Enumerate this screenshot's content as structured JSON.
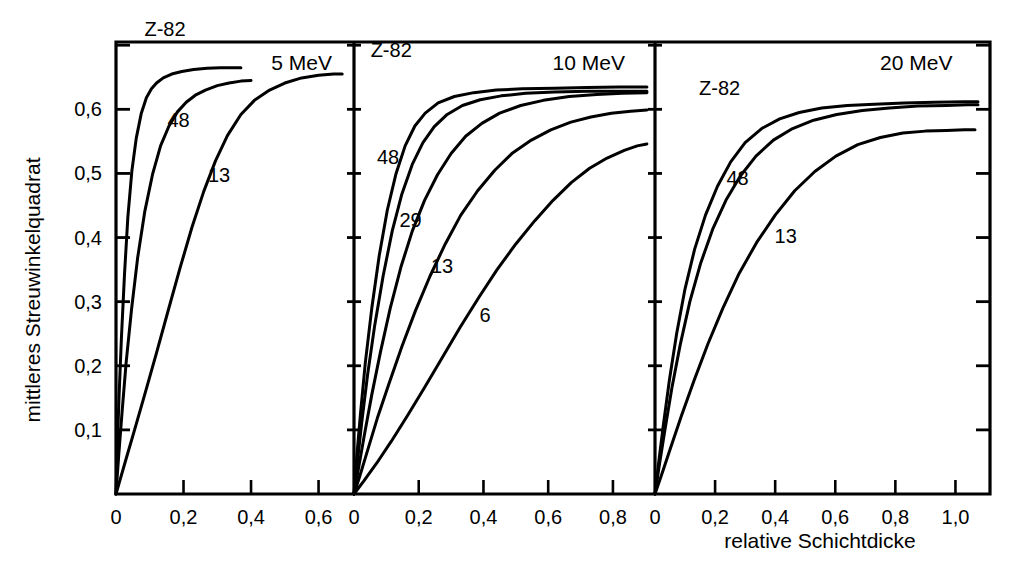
{
  "chart_data": {
    "type": "line",
    "title": "",
    "xlabel": "relative Schichtdicke",
    "ylabel": "mittleres Streuwinkelquadrat",
    "grid": false,
    "legend_position": "inline-curve-labels",
    "decimal_separator": "comma",
    "ylim": [
      0,
      0.705
    ],
    "y_ticks": [
      0.1,
      0.2,
      0.3,
      0.4,
      0.5,
      0.6,
      0.7
    ],
    "y_tick_labels": [
      "0,1",
      "0,2",
      "0,3",
      "0,4",
      "0,5",
      "0,6",
      ""
    ],
    "panels": [
      {
        "title": "5 MeV",
        "xlim": [
          0,
          0.705
        ],
        "x_ticks": [
          0,
          0.2,
          0.4,
          0.6
        ],
        "x_tick_labels": [
          "0",
          "0,2",
          "0,4",
          "0,6"
        ],
        "series": [
          {
            "name": "Z-82",
            "label": "Z-82",
            "x": [
              0,
              0.004,
              0.009,
              0.016,
              0.025,
              0.035,
              0.047,
              0.06,
              0.075,
              0.09,
              0.105,
              0.12,
              0.14,
              0.165,
              0.195,
              0.23,
              0.27,
              0.31,
              0.345,
              0.37
            ],
            "y": [
              0,
              0.075,
              0.152,
              0.243,
              0.341,
              0.431,
              0.504,
              0.555,
              0.594,
              0.618,
              0.632,
              0.641,
              0.649,
              0.655,
              0.659,
              0.662,
              0.664,
              0.665,
              0.665,
              0.665
            ]
          },
          {
            "name": "48",
            "label": "48",
            "x": [
              0,
              0.008,
              0.018,
              0.03,
              0.046,
              0.064,
              0.085,
              0.108,
              0.132,
              0.157,
              0.182,
              0.208,
              0.235,
              0.265,
              0.3,
              0.335,
              0.37,
              0.4
            ],
            "y": [
              0,
              0.06,
              0.128,
              0.205,
              0.288,
              0.368,
              0.44,
              0.498,
              0.543,
              0.574,
              0.596,
              0.611,
              0.622,
              0.63,
              0.637,
              0.641,
              0.644,
              0.645
            ]
          },
          {
            "name": "13",
            "label": "13",
            "x": [
              0,
              0.012,
              0.03,
              0.055,
              0.085,
              0.12,
              0.155,
              0.19,
              0.225,
              0.26,
              0.295,
              0.33,
              0.37,
              0.41,
              0.455,
              0.5,
              0.55,
              0.6,
              0.645,
              0.67
            ],
            "y": [
              0,
              0.022,
              0.055,
              0.1,
              0.155,
              0.22,
              0.287,
              0.353,
              0.416,
              0.472,
              0.52,
              0.559,
              0.592,
              0.614,
              0.63,
              0.641,
              0.649,
              0.653,
              0.655,
              0.655
            ]
          }
        ]
      },
      {
        "title": "10 MeV",
        "xlim": [
          0,
          0.93
        ],
        "x_ticks": [
          0,
          0.2,
          0.4,
          0.6,
          0.8
        ],
        "x_tick_labels": [
          "0",
          "0,2",
          "0,4",
          "0,6",
          "0,8"
        ],
        "series": [
          {
            "name": "Z-82",
            "label": "Z-82",
            "x": [
              0,
              0.008,
              0.02,
              0.035,
              0.055,
              0.078,
              0.103,
              0.13,
              0.158,
              0.188,
              0.22,
              0.26,
              0.31,
              0.37,
              0.44,
              0.52,
              0.62,
              0.72,
              0.82,
              0.905
            ],
            "y": [
              0,
              0.055,
              0.125,
              0.205,
              0.29,
              0.372,
              0.443,
              0.5,
              0.543,
              0.574,
              0.594,
              0.61,
              0.62,
              0.626,
              0.63,
              0.632,
              0.633,
              0.634,
              0.635,
              0.635
            ]
          },
          {
            "name": "48",
            "label": "48",
            "x": [
              0,
              0.01,
              0.024,
              0.042,
              0.064,
              0.09,
              0.118,
              0.148,
              0.18,
              0.213,
              0.248,
              0.288,
              0.335,
              0.39,
              0.455,
              0.53,
              0.62,
              0.72,
              0.82,
              0.905
            ],
            "y": [
              0,
              0.048,
              0.112,
              0.186,
              0.263,
              0.34,
              0.41,
              0.468,
              0.514,
              0.548,
              0.573,
              0.592,
              0.606,
              0.615,
              0.621,
              0.625,
              0.627,
              0.628,
              0.628,
              0.628
            ]
          },
          {
            "name": "29",
            "label": "29",
            "x": [
              0,
              0.014,
              0.032,
              0.055,
              0.082,
              0.112,
              0.145,
              0.18,
              0.218,
              0.258,
              0.3,
              0.345,
              0.395,
              0.45,
              0.515,
              0.585,
              0.665,
              0.75,
              0.83,
              0.905
            ],
            "y": [
              0,
              0.04,
              0.092,
              0.155,
              0.222,
              0.29,
              0.354,
              0.41,
              0.458,
              0.498,
              0.531,
              0.558,
              0.578,
              0.594,
              0.606,
              0.614,
              0.62,
              0.623,
              0.625,
              0.626
            ]
          },
          {
            "name": "13",
            "label": "13",
            "x": [
              0,
              0.018,
              0.042,
              0.072,
              0.108,
              0.148,
              0.19,
              0.235,
              0.282,
              0.33,
              0.382,
              0.435,
              0.49,
              0.548,
              0.608,
              0.67,
              0.732,
              0.795,
              0.855,
              0.905
            ],
            "y": [
              0,
              0.028,
              0.068,
              0.118,
              0.172,
              0.23,
              0.286,
              0.34,
              0.39,
              0.435,
              0.473,
              0.505,
              0.532,
              0.552,
              0.568,
              0.58,
              0.588,
              0.594,
              0.597,
              0.599
            ]
          },
          {
            "name": "6",
            "label": "6",
            "x": [
              0,
              0.03,
              0.07,
              0.115,
              0.165,
              0.218,
              0.272,
              0.328,
              0.385,
              0.442,
              0.5,
              0.558,
              0.615,
              0.672,
              0.728,
              0.782,
              0.835,
              0.875,
              0.905
            ],
            "y": [
              0,
              0.02,
              0.048,
              0.082,
              0.122,
              0.166,
              0.212,
              0.26,
              0.306,
              0.35,
              0.39,
              0.426,
              0.458,
              0.486,
              0.508,
              0.524,
              0.536,
              0.543,
              0.546
            ]
          }
        ]
      },
      {
        "title": "20 MeV",
        "xlim": [
          0,
          1.115
        ],
        "x_ticks": [
          0,
          0.2,
          0.4,
          0.6,
          0.8,
          1.0
        ],
        "x_tick_labels": [
          "0",
          "0,2",
          "0,4",
          "0,6",
          "0,8",
          "1,0"
        ],
        "series": [
          {
            "name": "Z-82",
            "label": "Z-82",
            "x": [
              0,
              0.012,
              0.028,
              0.048,
              0.072,
              0.1,
              0.132,
              0.168,
              0.208,
              0.252,
              0.3,
              0.355,
              0.415,
              0.48,
              0.555,
              0.64,
              0.73,
              0.83,
              0.93,
              1.03,
              1.075
            ],
            "y": [
              0,
              0.048,
              0.108,
              0.178,
              0.25,
              0.32,
              0.382,
              0.435,
              0.48,
              0.518,
              0.548,
              0.57,
              0.585,
              0.595,
              0.602,
              0.606,
              0.608,
              0.61,
              0.611,
              0.612,
              0.612
            ]
          },
          {
            "name": "48",
            "label": "48",
            "x": [
              0,
              0.014,
              0.033,
              0.056,
              0.084,
              0.116,
              0.152,
              0.192,
              0.236,
              0.284,
              0.336,
              0.394,
              0.458,
              0.528,
              0.605,
              0.69,
              0.78,
              0.875,
              0.97,
              1.04,
              1.075
            ],
            "y": [
              0,
              0.044,
              0.1,
              0.165,
              0.233,
              0.3,
              0.36,
              0.413,
              0.458,
              0.496,
              0.527,
              0.552,
              0.57,
              0.583,
              0.592,
              0.598,
              0.602,
              0.605,
              0.606,
              0.607,
              0.607
            ]
          },
          {
            "name": "13",
            "label": "13",
            "x": [
              0,
              0.022,
              0.052,
              0.088,
              0.13,
              0.176,
              0.226,
              0.28,
              0.338,
              0.4,
              0.465,
              0.532,
              0.602,
              0.675,
              0.75,
              0.825,
              0.9,
              0.97,
              1.03,
              1.065
            ],
            "y": [
              0,
              0.03,
              0.072,
              0.122,
              0.177,
              0.234,
              0.29,
              0.344,
              0.392,
              0.435,
              0.473,
              0.503,
              0.527,
              0.545,
              0.556,
              0.563,
              0.566,
              0.567,
              0.568,
              0.568
            ]
          }
        ]
      }
    ]
  }
}
